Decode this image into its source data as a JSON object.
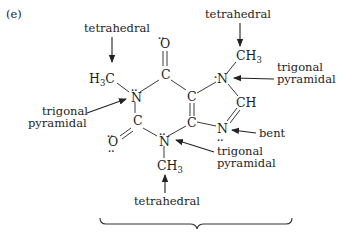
{
  "panel_label": "(e)",
  "annotations": {
    "top_left": "tetrahedral",
    "top_right": "tetrahedral",
    "right_line1": "trigonal",
    "right_line2": "pyramidal",
    "left_line1": "trigonal",
    "left_line2": "pyramidal",
    "bent": "bent",
    "bottom_right_line1": "trigonal",
    "bottom_right_line2": "pyramidal",
    "bottom": "tetrahedral"
  },
  "atoms": {
    "methyl_left": {
      "main": "H",
      "sub": "3",
      "tail": "C"
    },
    "n1": "N",
    "c_top": "C",
    "o_top": "O",
    "c_left": "C",
    "o_left": "O",
    "n_bottom": "N",
    "methyl_bottom": {
      "main": "CH",
      "sub": "3"
    },
    "c_center_top": "C",
    "c_center_bottom": "C",
    "n_right_top": "N",
    "methyl_right": {
      "main": "CH",
      "sub": "3"
    },
    "ch": "CH",
    "n_right_bottom": "N"
  },
  "lone_pair_marker": ".."
}
